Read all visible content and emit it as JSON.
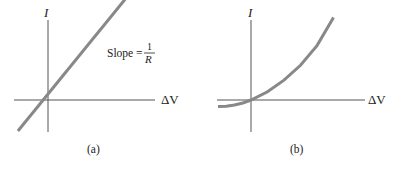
{
  "chart_data": [
    {
      "type": "line",
      "panel_label": "(a)",
      "xlabel": "ΔV",
      "ylabel": "I",
      "annotation": {
        "text": "Slope =",
        "numerator": "1",
        "denominator": "R"
      },
      "series": [
        {
          "name": "ohmic",
          "x": [
            -1,
            3.4
          ],
          "y": [
            -1,
            3.4
          ]
        }
      ],
      "xlim": [
        -1.05,
        3.3
      ],
      "ylim": [
        -1,
        2.5
      ],
      "grid": false,
      "color": "#888888"
    },
    {
      "type": "line",
      "panel_label": "(b)",
      "xlabel": "ΔV",
      "ylabel": "I",
      "series": [
        {
          "name": "nonohmic",
          "x": [
            -1,
            -0.75,
            -0.5,
            -0.25,
            0,
            0.5,
            1,
            1.5,
            2,
            2.5
          ],
          "y": [
            -0.2,
            -0.19,
            -0.15,
            -0.09,
            0,
            0.25,
            0.6,
            1.05,
            1.65,
            2.5
          ]
        }
      ],
      "xlim": [
        -1.05,
        3.5
      ],
      "ylim": [
        -1,
        2.5
      ],
      "grid": false,
      "color": "#888888"
    }
  ]
}
